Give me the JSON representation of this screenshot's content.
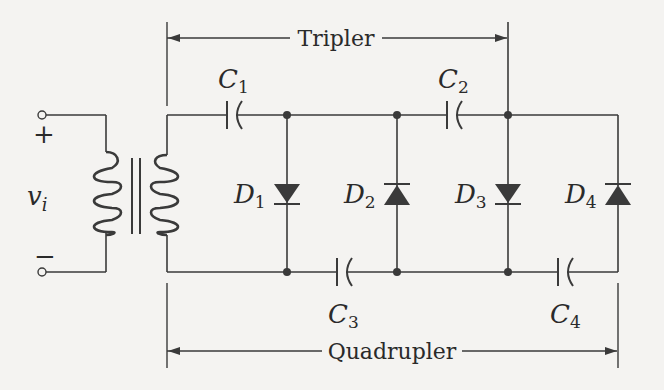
{
  "figure": {
    "type": "voltage multiplier circuit",
    "colors": {
      "ink": "#3a3a3a",
      "paper": "#f4f3f1"
    }
  },
  "brackets": {
    "tripler": {
      "label": "Tripler"
    },
    "quadrupler": {
      "label": "Quadrupler"
    }
  },
  "source": {
    "label": "v",
    "subscript": "i",
    "plus": "+",
    "minus": "−"
  },
  "components": {
    "capacitors": [
      {
        "name": "C",
        "sub": "1",
        "position": "top rail, between transformer and D1"
      },
      {
        "name": "C",
        "sub": "2",
        "position": "top rail, between D2 and D3"
      },
      {
        "name": "C",
        "sub": "3",
        "position": "bottom rail, between D1 and D2"
      },
      {
        "name": "C",
        "sub": "4",
        "position": "bottom rail, between D3 and D4"
      }
    ],
    "diodes": [
      {
        "name": "D",
        "sub": "1",
        "direction": "down"
      },
      {
        "name": "D",
        "sub": "2",
        "direction": "up"
      },
      {
        "name": "D",
        "sub": "3",
        "direction": "down"
      },
      {
        "name": "D",
        "sub": "4",
        "direction": "up"
      }
    ],
    "transformer": {
      "primary_turns": 4,
      "secondary_turns": 4,
      "core": "iron (two parallel lines)"
    }
  }
}
